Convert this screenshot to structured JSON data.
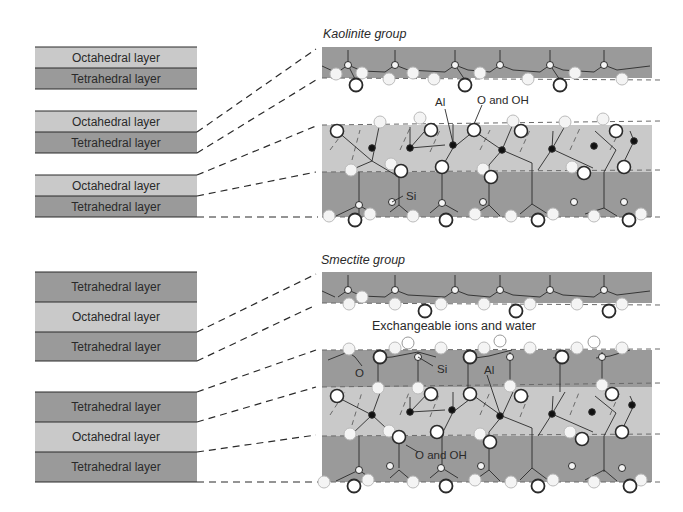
{
  "colors": {
    "tetrahedral": "#9a9a9a",
    "octahedral": "#c9c9c9",
    "outline": "#2a2a2a",
    "atom_fill": "#f4f4f4",
    "al_fill": "#111111"
  },
  "kaolinite": {
    "title": "Kaolinite group",
    "stacks": [
      {
        "layers": [
          {
            "label": "Octahedral layer",
            "type": "octahedral"
          },
          {
            "label": "Tetrahedral layer",
            "type": "tetrahedral"
          }
        ]
      },
      {
        "layers": [
          {
            "label": "Octahedral layer",
            "type": "octahedral"
          },
          {
            "label": "Tetrahedral layer",
            "type": "tetrahedral"
          }
        ]
      },
      {
        "layers": [
          {
            "label": "Octahedral layer",
            "type": "octahedral"
          },
          {
            "label": "Tetrahedral layer",
            "type": "tetrahedral"
          }
        ]
      }
    ],
    "annotations": {
      "al": "Al",
      "o_oh": "O and OH",
      "si": "Si"
    }
  },
  "smectite": {
    "title": "Smectite group",
    "stacks": [
      {
        "layers": [
          {
            "label": "Tetrahedral layer",
            "type": "tetrahedral"
          },
          {
            "label": "Octahedral layer",
            "type": "octahedral"
          },
          {
            "label": "Tetrahedral layer",
            "type": "tetrahedral"
          }
        ]
      },
      {
        "layers": [
          {
            "label": "Tetrahedral layer",
            "type": "tetrahedral"
          },
          {
            "label": "Octahedral layer",
            "type": "octahedral"
          },
          {
            "label": "Tetrahedral layer",
            "type": "tetrahedral"
          }
        ]
      }
    ],
    "interlayer_label": "Exchangeable ions and water",
    "annotations": {
      "o": "O",
      "si": "Si",
      "al": "Al",
      "o_oh": "O and OH"
    }
  }
}
